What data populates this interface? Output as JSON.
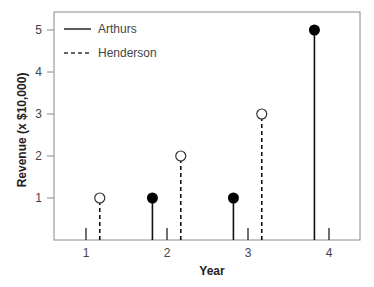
{
  "chart_data": {
    "type": "stem",
    "title": "",
    "xlabel": "Year",
    "ylabel": "Revenue (x $10,000)",
    "x_ticks": [
      "1",
      "2",
      "3",
      "4"
    ],
    "y_ticks": [
      "1",
      "2",
      "3",
      "4",
      "5"
    ],
    "xlim": [
      0.6,
      4.35
    ],
    "ylim": [
      0,
      5.3
    ],
    "grid": false,
    "legend_position": "upper left",
    "categories": [
      1,
      2,
      3,
      4
    ],
    "series": [
      {
        "name": "Arthurs",
        "values": [
          0,
          1,
          1,
          5
        ],
        "line_style": "solid",
        "marker": "filled-circle",
        "x_offset": -0.18,
        "color": "#000000"
      },
      {
        "name": "Henderson",
        "values": [
          1,
          2,
          3,
          0
        ],
        "line_style": "dashed",
        "marker": "open-circle",
        "x_offset": 0.17,
        "color": "#000000"
      }
    ]
  },
  "legend": {
    "items": [
      {
        "label": "Arthurs"
      },
      {
        "label": "Henderson"
      }
    ]
  },
  "axes": {
    "x_title": "Year",
    "y_title": "Revenue (x $10,000)",
    "frame_color": "#8a8a8a"
  }
}
